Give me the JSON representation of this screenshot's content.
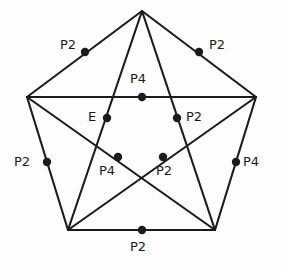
{
  "figure": {
    "name": "labeled-pentagram-symmetry-diagram",
    "background_color": "#fdfdfd",
    "stroke_color": "#1b1b1b",
    "dot_color": "#1b1b1b",
    "stroke_width": 2.1,
    "dot_radius": 4.2,
    "label_font_size_px": 13,
    "vertices": {
      "top": {
        "x": 142,
        "y": 11
      },
      "right": {
        "x": 256,
        "y": 97
      },
      "bottom_right": {
        "x": 215,
        "y": 230
      },
      "bottom_left": {
        "x": 68,
        "y": 230
      },
      "left": {
        "x": 27,
        "y": 97
      }
    },
    "outer_edges": [
      {
        "name": "edge-top-left",
        "from": "top",
        "to": "left"
      },
      {
        "name": "edge-top-right",
        "from": "top",
        "to": "right"
      },
      {
        "name": "edge-right-lower",
        "from": "right",
        "to": "bottom_right"
      },
      {
        "name": "edge-bottom",
        "from": "bottom_right",
        "to": "bottom_left"
      },
      {
        "name": "edge-left-lower",
        "from": "bottom_left",
        "to": "left"
      }
    ],
    "diagonals": [
      {
        "name": "diagonal-left-right",
        "from": "left",
        "to": "right"
      },
      {
        "name": "diagonal-left-bottomright",
        "from": "left",
        "to": "bottom_right"
      },
      {
        "name": "diagonal-right-bottomleft",
        "from": "right",
        "to": "bottom_left"
      },
      {
        "name": "diagonal-top-bottomleft",
        "from": "top",
        "to": "bottom_left"
      },
      {
        "name": "diagonal-top-bottomright",
        "from": "top",
        "to": "bottom_right"
      }
    ],
    "points": [
      {
        "id": "pt-upper-left-edge",
        "label": "P2",
        "dot": {
          "x": 85,
          "y": 52
        },
        "label_pos": {
          "x": 60,
          "y": 38
        },
        "label_anchor": "right-of-dot-left"
      },
      {
        "id": "pt-upper-right-edge",
        "label": "P2",
        "dot": {
          "x": 199,
          "y": 52
        },
        "label_pos": {
          "x": 209,
          "y": 38
        },
        "label_anchor": "left-of-dot-right"
      },
      {
        "id": "pt-center-top-diagonal",
        "label": "P4",
        "dot": {
          "x": 142,
          "y": 97
        },
        "label_pos": {
          "x": 130,
          "y": 72
        },
        "label_anchor": "above"
      },
      {
        "id": "pt-inner-left",
        "label": "E",
        "dot": {
          "x": 107,
          "y": 118
        },
        "label_pos": {
          "x": 88,
          "y": 110
        },
        "label_anchor": "left"
      },
      {
        "id": "pt-inner-right",
        "label": "P2",
        "dot": {
          "x": 177,
          "y": 118
        },
        "label_pos": {
          "x": 186,
          "y": 110
        },
        "label_anchor": "right"
      },
      {
        "id": "pt-left-edge",
        "label": "P2",
        "dot": {
          "x": 47,
          "y": 162
        },
        "label_pos": {
          "x": 14,
          "y": 155
        },
        "label_anchor": "left"
      },
      {
        "id": "pt-right-edge",
        "label": "P4",
        "dot": {
          "x": 236,
          "y": 162
        },
        "label_pos": {
          "x": 243,
          "y": 155
        },
        "label_anchor": "right"
      },
      {
        "id": "pt-inner-lower-left",
        "label": "P4",
        "dot": {
          "x": 118,
          "y": 157
        },
        "label_pos": {
          "x": 99,
          "y": 164
        },
        "label_anchor": "below-left"
      },
      {
        "id": "pt-inner-lower-right",
        "label": "P2",
        "dot": {
          "x": 163,
          "y": 157
        },
        "label_pos": {
          "x": 156,
          "y": 164
        },
        "label_anchor": "below-right"
      },
      {
        "id": "pt-bottom-edge",
        "label": "P2",
        "dot": {
          "x": 142,
          "y": 230
        },
        "label_pos": {
          "x": 130,
          "y": 240
        },
        "label_anchor": "below"
      }
    ]
  }
}
